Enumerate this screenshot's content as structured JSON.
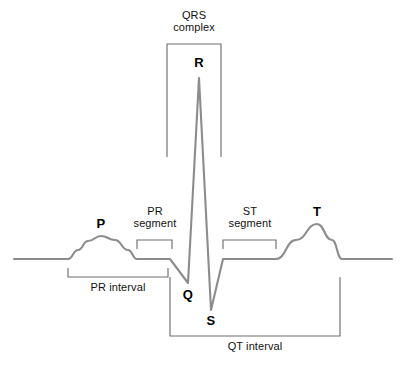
{
  "figure": {
    "background_color": "#ffffff",
    "trace_color": "#8c8c8c",
    "bracket_color": "#6e6e6e",
    "label_color": "#000000"
  },
  "labels": {
    "qrs_complex": "QRS\ncomplex",
    "r": "R",
    "p": "P",
    "q": "Q",
    "s": "S",
    "t": "T",
    "pr_segment": "PR\nsegment",
    "st_segment": "ST\nsegment",
    "pr_interval": "PR interval",
    "qt_interval": "QT interval"
  },
  "chart_data": {
    "type": "line",
    "xlabel": "",
    "ylabel": "",
    "grid": false,
    "legend": "none",
    "xlim": [
      0,
      406
    ],
    "ylim": [
      365,
      0
    ],
    "baseline_y": 259,
    "series": [
      {
        "name": "ecg-trace",
        "color": "#8c8c8c",
        "points": [
          [
            14,
            259
          ],
          [
            68,
            259
          ],
          [
            78,
            250
          ],
          [
            88,
            241
          ],
          [
            101,
            236
          ],
          [
            115,
            240
          ],
          [
            128,
            250
          ],
          [
            137,
            259
          ],
          [
            170,
            259
          ],
          [
            188,
            283
          ],
          [
            199,
            78
          ],
          [
            211,
            310
          ],
          [
            223,
            259
          ],
          [
            276,
            259
          ],
          [
            296,
            240
          ],
          [
            317,
            224
          ],
          [
            332,
            240
          ],
          [
            342,
            259
          ],
          [
            392,
            259
          ]
        ]
      }
    ],
    "annotations": [
      {
        "name": "P",
        "x": 101,
        "y": 236,
        "label": "P",
        "label_x": 101,
        "label_y": 217
      },
      {
        "name": "R",
        "x": 199,
        "y": 78,
        "label": "R",
        "label_x": 199,
        "label_y": 56
      },
      {
        "name": "Q",
        "x": 188,
        "y": 283,
        "label": "Q",
        "label_x": 188,
        "label_y": 288
      },
      {
        "name": "S",
        "x": 211,
        "y": 310,
        "label": "S",
        "label_x": 211,
        "label_y": 314
      },
      {
        "name": "T",
        "x": 317,
        "y": 224,
        "label": "T",
        "label_x": 317,
        "label_y": 205
      }
    ],
    "brackets": [
      {
        "name": "qrs-complex",
        "label": "QRS\ncomplex",
        "orientation": "down",
        "x1": 167,
        "x2": 221,
        "y": 44,
        "tick": 113,
        "label_x": 194,
        "label_y": 9
      },
      {
        "name": "pr-segment",
        "label": "PR\nsegment",
        "orientation": "down",
        "x1": 137,
        "x2": 172,
        "y": 240,
        "tick": 9,
        "label_x": 155,
        "label_y": 205
      },
      {
        "name": "st-segment",
        "label": "ST\nsegment",
        "orientation": "down",
        "x1": 223,
        "x2": 276,
        "y": 240,
        "tick": 9,
        "label_x": 250,
        "label_y": 205
      },
      {
        "name": "pr-interval",
        "label": "PR interval",
        "orientation": "up",
        "x1": 68,
        "x2": 168,
        "y": 277,
        "tick": 9,
        "label_x": 118,
        "label_y": 281
      },
      {
        "name": "qt-interval",
        "label": "QT interval",
        "orientation": "up",
        "x1": 170,
        "x2": 340,
        "y": 336,
        "tick": 59,
        "label_x": 255,
        "label_y": 340
      }
    ]
  }
}
